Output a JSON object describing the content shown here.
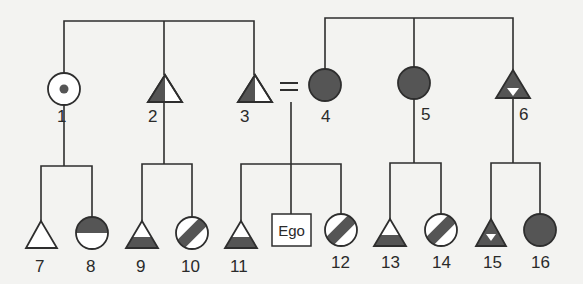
{
  "diagram": {
    "type": "kinship-chart",
    "colors": {
      "line": "#2e2e2e",
      "fill_dark": "#555555",
      "fill_light": "#ffffff",
      "background": "#f3f3f1"
    },
    "ego_label": "Ego",
    "marriage_symbol": "=",
    "parents_generation": [
      {
        "id": "1",
        "label": "1",
        "shape": "circle",
        "marking": "central-dot"
      },
      {
        "id": "2",
        "label": "2",
        "shape": "triangle",
        "marking": "left-half-dark"
      },
      {
        "id": "3",
        "label": "3",
        "shape": "triangle",
        "marking": "left-half-dark"
      },
      {
        "id": "4",
        "label": "4",
        "shape": "circle",
        "marking": "solid-dark"
      },
      {
        "id": "5",
        "label": "5",
        "shape": "circle",
        "marking": "solid-dark"
      },
      {
        "id": "6",
        "label": "6",
        "shape": "triangle",
        "marking": "dark-with-inverted-white-triangle"
      }
    ],
    "ego_generation": [
      {
        "id": "7",
        "label": "7",
        "shape": "triangle",
        "marking": "empty"
      },
      {
        "id": "8",
        "label": "8",
        "shape": "circle",
        "marking": "top-half-dark"
      },
      {
        "id": "9",
        "label": "9",
        "shape": "triangle",
        "marking": "bottom-band-dark"
      },
      {
        "id": "10",
        "label": "10",
        "shape": "circle",
        "marking": "diagonal-bar"
      },
      {
        "id": "11",
        "label": "11",
        "shape": "triangle",
        "marking": "bottom-band-dark"
      },
      {
        "id": "ego",
        "label": "Ego",
        "shape": "square",
        "marking": "text"
      },
      {
        "id": "12",
        "label": "12",
        "shape": "circle",
        "marking": "diagonal-bar"
      },
      {
        "id": "13",
        "label": "13",
        "shape": "triangle",
        "marking": "bottom-band-dark"
      },
      {
        "id": "14",
        "label": "14",
        "shape": "circle",
        "marking": "diagonal-bar"
      },
      {
        "id": "15",
        "label": "15",
        "shape": "triangle",
        "marking": "dark-with-inverted-white-triangle"
      },
      {
        "id": "16",
        "label": "16",
        "shape": "circle",
        "marking": "solid-dark"
      }
    ]
  }
}
